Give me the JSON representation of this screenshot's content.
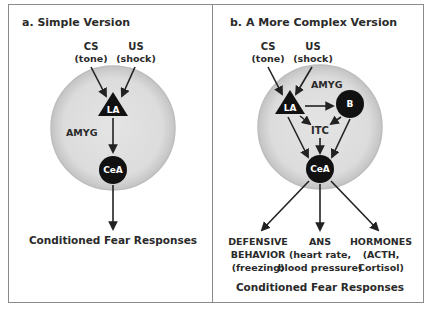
{
  "panel_a": {
    "title": "a. Simple Version",
    "cs_label": "CS",
    "cs_sub": "(tone)",
    "us_label": "US",
    "us_sub": "(shock)",
    "region_label": "AMYG",
    "la_label": "LA",
    "cea_label": "CeA",
    "output_label": "Conditioned Fear Responses"
  },
  "panel_b": {
    "title": "b. A More Complex Version",
    "cs_label": "CS",
    "cs_sub": "(tone)",
    "us_label": "US",
    "us_sub": "(shock)",
    "region_label": "AMYG",
    "la_label": "LA",
    "b_label": "B",
    "itc_label": "ITC",
    "cea_label": "CeA",
    "outputs": [
      {
        "line1": "DEFENSIVE",
        "line2": "BEHAVIOR",
        "line3": "(freezing)"
      },
      {
        "line1": "ANS",
        "line2": "(heart rate,",
        "line3": "blood pressure)"
      },
      {
        "line1": "HORMONES",
        "line2": "(ACTH,",
        "line3": "Cortisol)"
      }
    ],
    "output_label": "Conditioned Fear Responses"
  },
  "colors": {
    "amygdala_fill": "#d9d9d9",
    "amygdala_edge": "#b5b5b5",
    "node_fill": "#111111",
    "arrow": "#222222",
    "frame": "#8a8a8a"
  }
}
